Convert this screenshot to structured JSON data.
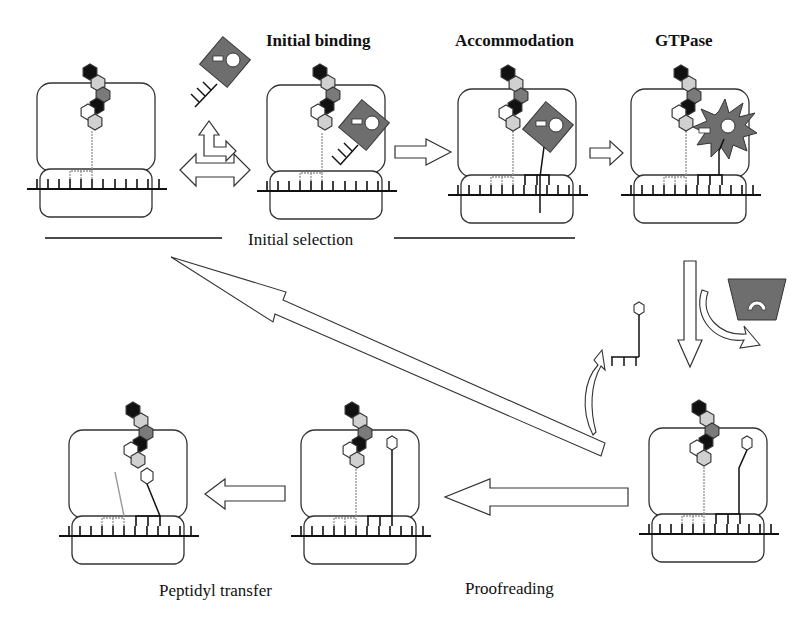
{
  "figure": {
    "stage_titles": {
      "initial_binding": "Initial binding",
      "accommodation": "Accommodation",
      "gtpase": "GTPase"
    },
    "phase_labels": {
      "initial_selection": "Initial selection",
      "proofreading": "Proofreading",
      "peptidyl_transfer": "Peptidyl transfer"
    },
    "panels": [
      {
        "id": "empty-a-site",
        "ternary_complex": "free",
        "position": "top-left"
      },
      {
        "id": "initial-binding",
        "ternary_complex": "bound-codon-recognition",
        "position": "top-2"
      },
      {
        "id": "accommodation-pre",
        "ternary_complex": "codon-paired",
        "position": "top-3"
      },
      {
        "id": "gtpase-activation",
        "ternary_complex": "ef-tu-activated",
        "position": "top-right"
      },
      {
        "id": "accommodation-post",
        "ternary_complex": "released-trna",
        "position": "bottom-right"
      },
      {
        "id": "proofreading-accepted",
        "ternary_complex": "trna-accommodated",
        "position": "bottom-middle"
      },
      {
        "id": "peptidyl-transfer",
        "ternary_complex": "peptide-transferred",
        "position": "bottom-left"
      }
    ],
    "colors": {
      "black_residue": "#111111",
      "light_residue": "#d0d0d0",
      "dark_residue": "#7a7a7a",
      "white_residue": "#ffffff",
      "ef_tu": "#6e6e6e",
      "outline": "#333333"
    }
  }
}
